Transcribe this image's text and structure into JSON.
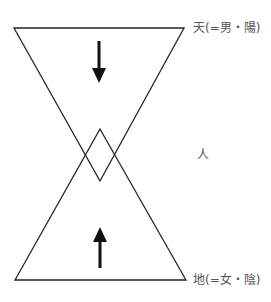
{
  "diagram": {
    "labels": {
      "heaven": "天(=男・陽)",
      "human": "人",
      "earth": "地(=女・陰)"
    },
    "shapes": {
      "top_triangle": {
        "points": "14,28 184,28 100,181",
        "direction": "downward"
      },
      "bottom_triangle": {
        "points": "15,280 186,280 100,129",
        "direction": "upward"
      },
      "down_arrow": {
        "x": 99,
        "y1": 41,
        "y2": 82
      },
      "up_arrow": {
        "x": 100,
        "y1": 268,
        "y2": 228
      }
    },
    "colors": {
      "line": "#222222",
      "text": "#555555"
    }
  }
}
